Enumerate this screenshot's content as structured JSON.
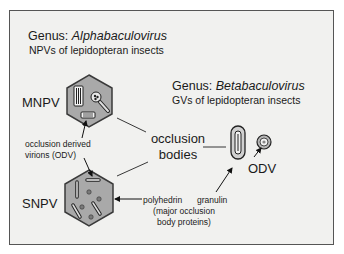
{
  "alpha": {
    "genus_prefix": "Genus: ",
    "genus_name": "Alphabaculovirus",
    "description": "NPVs of lepidopteran insects"
  },
  "beta": {
    "genus_prefix": "Genus: ",
    "genus_name": "Betabaculovirus",
    "description": "GVs of lepidopteran insects"
  },
  "labels": {
    "mnpv": "MNPV",
    "snpv": "SNPV",
    "odv_line1": "occlusion derived",
    "odv_line2": "virions (ODV)",
    "ob_line1": "occlusion",
    "ob_line2": "bodies",
    "odv_short": "ODV",
    "polyhedrin": "polyhedrin",
    "granulin": "granulin",
    "protein_line1": "(major occlusion",
    "protein_line2": "body proteins)"
  },
  "colors": {
    "frame_bg": "#f1f1ef",
    "frame_border": "#555555",
    "hexagon_fill": "#a9a9a9",
    "hexagon_stroke": "#3a3a3a",
    "particle_fill": "#7a7a7a"
  }
}
